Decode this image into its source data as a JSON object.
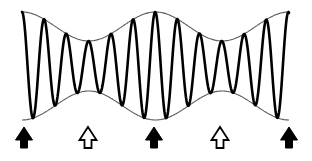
{
  "diagram": {
    "title": "",
    "colors": {
      "carrier": "#000000",
      "envelope": "#5a5a5a",
      "arrow_fill": "#000000",
      "background": "#ffffff"
    },
    "wave": {
      "x_start": 22,
      "x_end": 289,
      "center_y": 66,
      "carrier_half_period_px": 11.1,
      "beat_period_px": 133.5,
      "amplitude_max": 54,
      "amplitude_min": 25,
      "max_positions_x": [
        22,
        155.5,
        289
      ],
      "min_positions_x": [
        88.7,
        222.2
      ]
    },
    "arrows": [
      {
        "x": 24,
        "type": "filled",
        "label": "envelope-maximum"
      },
      {
        "x": 88,
        "type": "outline",
        "label": "envelope-minimum"
      },
      {
        "x": 154,
        "type": "filled",
        "label": "envelope-maximum"
      },
      {
        "x": 220,
        "type": "outline",
        "label": "envelope-minimum"
      },
      {
        "x": 289,
        "type": "filled",
        "label": "envelope-maximum"
      }
    ],
    "arrow_geometry": {
      "tip_y": 127,
      "head_base_y": 140,
      "bottom_y": 148,
      "head_half_width": 8.5,
      "shaft_half_width": 3.5
    }
  }
}
